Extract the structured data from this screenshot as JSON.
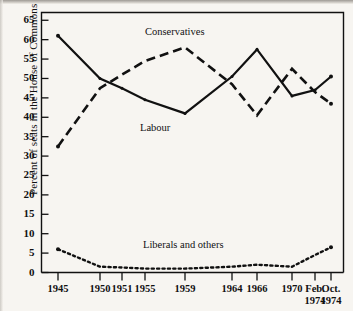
{
  "figure": {
    "background_color": "#f7f5f1",
    "ink_color": "#111111"
  },
  "chart_data": {
    "type": "line",
    "title": "",
    "xlabel": "",
    "ylabel": "Percent of seats in the House of Commons",
    "ylim": [
      0,
      67
    ],
    "yticks": [
      0,
      5,
      10,
      15,
      20,
      25,
      30,
      35,
      40,
      45,
      50,
      55,
      60,
      65
    ],
    "ytick_labels": [
      "0",
      "5",
      "10",
      "15",
      "20",
      "25",
      "30",
      "35",
      "40",
      "45",
      "50",
      "55",
      "60",
      "65"
    ],
    "categories": [
      "1945",
      "1950",
      "1951",
      "1955",
      "1959",
      "1964",
      "1966",
      "1970",
      "Feb. 1974",
      "Oct. 1974"
    ],
    "xtick_labels": [
      {
        "line1": "1945",
        "line2": ""
      },
      {
        "line1": "1950",
        "line2": ""
      },
      {
        "line1": "1951",
        "line2": ""
      },
      {
        "line1": "1955",
        "line2": ""
      },
      {
        "line1": "1959",
        "line2": ""
      },
      {
        "line1": "1964",
        "line2": ""
      },
      {
        "line1": "1966",
        "line2": ""
      },
      {
        "line1": "1970",
        "line2": ""
      },
      {
        "line1": "Feb.",
        "line2": "1974"
      },
      {
        "line1": "Oct.",
        "line2": "1974"
      }
    ],
    "grid": false,
    "legend_position": "inline-annotations",
    "series": [
      {
        "name": "Labour",
        "style": "solid",
        "values": [
          61,
          50,
          47.5,
          44.5,
          41,
          50.5,
          57.5,
          45.5,
          47,
          50.5
        ]
      },
      {
        "name": "Conservatives",
        "style": "dashed",
        "values": [
          32.5,
          47.5,
          51,
          54.5,
          58,
          48.5,
          40.5,
          52.5,
          46.5,
          43.5
        ]
      },
      {
        "name": "Liberals and others",
        "style": "dotted",
        "values": [
          6,
          1.5,
          1.3,
          1,
          1,
          1.5,
          2,
          1.5,
          4.5,
          6.5
        ]
      }
    ],
    "annotations": [
      {
        "text": "Conservatives",
        "x_px": 145,
        "y_px": 26
      },
      {
        "text": "Labour",
        "x_px": 140,
        "y_px": 122
      },
      {
        "text": "Liberals and others",
        "x_px": 143,
        "y_px": 239
      }
    ]
  }
}
